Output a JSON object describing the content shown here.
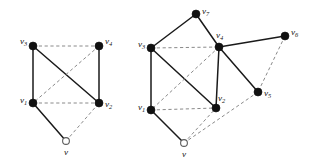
{
  "figure": {
    "background_color": "#ffffff",
    "solid_edge_color": "#1a1a1a",
    "dashed_edge_color": "#8a8a8a",
    "filled_node_color": "#111111",
    "hollow_node_fill": "#ffffff",
    "hollow_node_stroke": "#5d5d5d"
  },
  "graphs": [
    {
      "id": "left-graph",
      "name": "left-graph",
      "nodes": [
        {
          "id": "v3",
          "label": "v",
          "sub": "3",
          "x": 33,
          "y": 46,
          "type": "filled",
          "r": 4.0,
          "label_dx": -13,
          "label_dy": -4
        },
        {
          "id": "v4",
          "label": "v",
          "sub": "4",
          "x": 99,
          "y": 46,
          "type": "filled",
          "r": 4.0,
          "label_dx": 6,
          "label_dy": -4
        },
        {
          "id": "v1",
          "label": "v",
          "sub": "1",
          "x": 33,
          "y": 103,
          "type": "filled",
          "r": 4.0,
          "label_dx": -13,
          "label_dy": -2
        },
        {
          "id": "v2",
          "label": "v",
          "sub": "2",
          "x": 99,
          "y": 103,
          "type": "filled",
          "r": 4.0,
          "label_dx": 6,
          "label_dy": 2
        },
        {
          "id": "v",
          "label": "v",
          "sub": "",
          "x": 66,
          "y": 141,
          "type": "hollow",
          "r": 3.4,
          "label_dx": -2,
          "label_dy": 12
        }
      ],
      "edges": [
        {
          "from": "v3",
          "to": "v4",
          "style": "dashed"
        },
        {
          "from": "v3",
          "to": "v1",
          "style": "solid"
        },
        {
          "from": "v3",
          "to": "v2",
          "style": "solid"
        },
        {
          "from": "v4",
          "to": "v2",
          "style": "solid"
        },
        {
          "from": "v4",
          "to": "v1",
          "style": "dashed"
        },
        {
          "from": "v1",
          "to": "v2",
          "style": "dashed"
        },
        {
          "from": "v1",
          "to": "v",
          "style": "solid"
        },
        {
          "from": "v",
          "to": "v2",
          "style": "dashed"
        }
      ]
    },
    {
      "id": "right-graph",
      "name": "right-graph",
      "nodes": [
        {
          "id": "v7",
          "label": "v",
          "sub": "7",
          "x": 196,
          "y": 14,
          "type": "filled",
          "r": 4.0,
          "label_dx": 6,
          "label_dy": -2
        },
        {
          "id": "v3",
          "label": "v",
          "sub": "3",
          "x": 151,
          "y": 48,
          "type": "filled",
          "r": 4.0,
          "label_dx": -13,
          "label_dy": -3
        },
        {
          "id": "v4",
          "label": "v",
          "sub": "4",
          "x": 219,
          "y": 47,
          "type": "filled",
          "r": 4.0,
          "label_dx": -3,
          "label_dy": -11
        },
        {
          "id": "v6",
          "label": "v",
          "sub": "6",
          "x": 285,
          "y": 36,
          "type": "filled",
          "r": 4.0,
          "label_dx": 6,
          "label_dy": -3
        },
        {
          "id": "v5",
          "label": "v",
          "sub": "5",
          "x": 258,
          "y": 92,
          "type": "filled",
          "r": 4.0,
          "label_dx": 6,
          "label_dy": 2
        },
        {
          "id": "v1",
          "label": "v",
          "sub": "1",
          "x": 151,
          "y": 110,
          "type": "filled",
          "r": 4.0,
          "label_dx": -13,
          "label_dy": -2
        },
        {
          "id": "v2",
          "label": "v",
          "sub": "2",
          "x": 216,
          "y": 108,
          "type": "filled",
          "r": 4.0,
          "label_dx": 2,
          "label_dy": -9
        },
        {
          "id": "v",
          "label": "v",
          "sub": "",
          "x": 184,
          "y": 143,
          "type": "hollow",
          "r": 3.4,
          "label_dx": -2,
          "label_dy": 12
        }
      ],
      "edges": [
        {
          "from": "v3",
          "to": "v7",
          "style": "solid"
        },
        {
          "from": "v7",
          "to": "v4",
          "style": "solid"
        },
        {
          "from": "v3",
          "to": "v4",
          "style": "dashed"
        },
        {
          "from": "v3",
          "to": "v1",
          "style": "solid"
        },
        {
          "from": "v3",
          "to": "v2",
          "style": "solid"
        },
        {
          "from": "v4",
          "to": "v1",
          "style": "dashed"
        },
        {
          "from": "v4",
          "to": "v2",
          "style": "solid"
        },
        {
          "from": "v4",
          "to": "v6",
          "style": "solid"
        },
        {
          "from": "v4",
          "to": "v5",
          "style": "solid"
        },
        {
          "from": "v6",
          "to": "v5",
          "style": "dashed"
        },
        {
          "from": "v5",
          "to": "v",
          "style": "dashed"
        },
        {
          "from": "v1",
          "to": "v2",
          "style": "dashed"
        },
        {
          "from": "v1",
          "to": "v",
          "style": "solid"
        },
        {
          "from": "v",
          "to": "v2",
          "style": "dashed"
        }
      ]
    }
  ]
}
